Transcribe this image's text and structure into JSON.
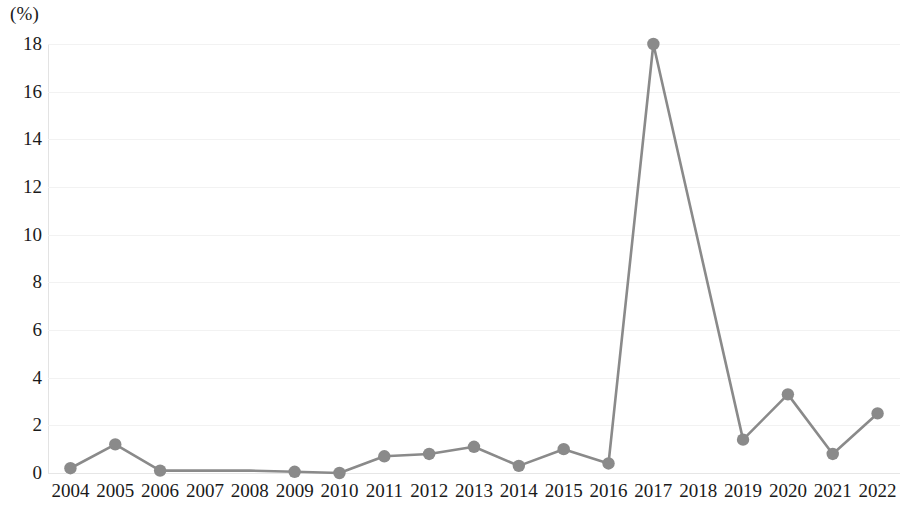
{
  "chart_data": {
    "type": "line",
    "title": "",
    "subtitle": "",
    "xlabel": "",
    "ylabel": "",
    "unit_label": "(%)",
    "categories": [
      "2004",
      "2005",
      "2006",
      "2007",
      "2008",
      "2009",
      "2010",
      "2011",
      "2012",
      "2013",
      "2014",
      "2015",
      "2016",
      "2017",
      "2018",
      "2019",
      "2020",
      "2021",
      "2022"
    ],
    "values": [
      0.2,
      1.2,
      0.1,
      0.1,
      0.1,
      0.05,
      0.0,
      0.7,
      0.8,
      1.1,
      0.3,
      1.0,
      0.4,
      18.0,
      9.7,
      1.4,
      3.3,
      0.8,
      2.5
    ],
    "markers_shown": [
      true,
      true,
      true,
      false,
      false,
      true,
      true,
      true,
      true,
      true,
      true,
      true,
      true,
      true,
      false,
      true,
      true,
      true,
      true
    ],
    "ylim": [
      0,
      18
    ],
    "yticks": [
      0,
      2,
      4,
      6,
      8,
      10,
      12,
      14,
      16,
      18
    ],
    "ytick_labels": [
      "0",
      "2",
      "4",
      "6",
      "8",
      "10",
      "12",
      "14",
      "16",
      "18"
    ],
    "grid": true,
    "grid_axis": "y",
    "legend": "none",
    "series": [
      {
        "name": "series-1",
        "color": "#8a8a8a",
        "marker": "circle",
        "values": [
          0.2,
          1.2,
          0.1,
          0.1,
          0.1,
          0.05,
          0.0,
          0.7,
          0.8,
          1.1,
          0.3,
          1.0,
          0.4,
          18.0,
          9.7,
          1.4,
          3.3,
          0.8,
          2.5
        ]
      }
    ],
    "colors": {
      "line": "#8a8a8a",
      "marker": "#8a8a8a",
      "grid": "#f2f2f2",
      "axis": "#e3e3e3",
      "baseline": "#e6e6e6",
      "text": "#1a1a1a",
      "background": "#ffffff"
    }
  }
}
